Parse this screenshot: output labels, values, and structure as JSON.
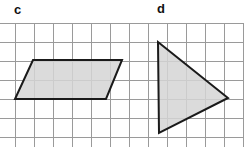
{
  "figure": {
    "width": 244,
    "height": 147,
    "background_color": "#ffffff"
  },
  "labels": [
    {
      "id": "c",
      "text": "c",
      "x": 14,
      "y": 3,
      "color": "#111111"
    },
    {
      "id": "d",
      "text": "d",
      "x": 157,
      "y": 2,
      "color": "#111111"
    }
  ],
  "grid": {
    "line_color": "#9a9a9a",
    "line_width": 1,
    "cell_size": 19,
    "origin_x": 15,
    "origin_y": 23,
    "top": 23,
    "bottom": 147,
    "left": 0,
    "right": 244,
    "vertical_lines_x": [
      15,
      34,
      53,
      72,
      91,
      110,
      129,
      148,
      167,
      186,
      205,
      224,
      243
    ],
    "horizontal_lines_y": [
      23,
      42,
      61,
      80,
      99,
      118,
      137
    ]
  },
  "shapes": [
    {
      "id": "parallelogram-c",
      "name": "parallelogram",
      "label": "c",
      "fill_color": "#d5d5d5",
      "stroke_color": "#1a1a1a",
      "stroke_width": 2,
      "points": "33,60 122,60 106,99 15,99",
      "vertices": [
        {
          "x": 33,
          "y": 60
        },
        {
          "x": 122,
          "y": 60
        },
        {
          "x": 106,
          "y": 99
        },
        {
          "x": 15,
          "y": 99
        }
      ]
    },
    {
      "id": "triangle-d",
      "name": "triangle",
      "label": "d",
      "fill_color": "#d5d5d5",
      "stroke_color": "#1a1a1a",
      "stroke_width": 2,
      "points": "158,42 228,98 159,133",
      "vertices": [
        {
          "x": 158,
          "y": 42
        },
        {
          "x": 228,
          "y": 98
        },
        {
          "x": 159,
          "y": 133
        }
      ]
    }
  ]
}
